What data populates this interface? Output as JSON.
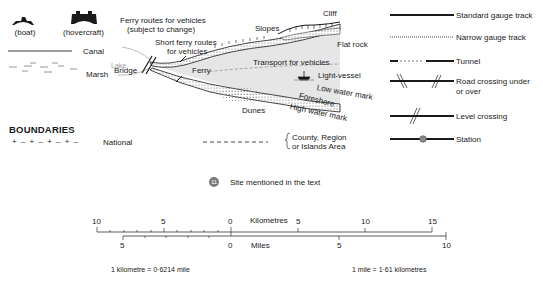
{
  "ferry_symbols": {
    "boat_label": "(boat)",
    "hovercraft_label": "(hovercraft)",
    "boat_icon": "boat-icon",
    "hovercraft_icon": "hovercraft-icon"
  },
  "water_features": {
    "canal": "Canal",
    "marsh": "Marsh",
    "lake": "Lake"
  },
  "coast_diagram": {
    "ferry_routes": "Ferry routes for vehicles",
    "ferry_routes_sub": "(subject to change)",
    "short_ferry_1": "Short ferry routes",
    "short_ferry_2": "for vehicles",
    "bridge": "Bridge",
    "ferry": "Ferry",
    "slopes": "Slopes",
    "cliff": "Cliff",
    "flat_rock": "Flat rock",
    "transport": "Transport for vehicles",
    "light_vessel": "Light-vessel",
    "light_vessel_icon": "light-vessel-icon",
    "low_water": "Low water mark",
    "foreshore": "Foreshore",
    "high_water": "High water mark",
    "dunes": "Dunes"
  },
  "railway_legend": [
    {
      "label": "Standard gauge track",
      "style": "solid"
    },
    {
      "label": "Narrow gauge track",
      "style": "dotted"
    },
    {
      "label": "Tunnel",
      "style": "tunnel"
    },
    {
      "label": "Road crossing under",
      "label2": "or over",
      "style": "road-crossing"
    },
    {
      "label": "Level crossing",
      "style": "level-crossing"
    },
    {
      "label": "Station",
      "style": "station"
    }
  ],
  "boundaries": {
    "heading": "BOUNDARIES",
    "national_symbol": "+ – + – + – + –",
    "national": "National",
    "county_1": "County, Region",
    "county_2": "or Islands Area"
  },
  "site": {
    "number": "11",
    "label": "Site mentioned in the text",
    "color": "#7a7a7a"
  },
  "scale": {
    "km_label": "Kilometres",
    "km_ticks": [
      "10",
      "5",
      "0",
      "5",
      "10",
      "15"
    ],
    "miles_label": "Miles",
    "miles_ticks": [
      "5",
      "0",
      "5",
      "10"
    ],
    "km_to_mile": "1 kilometre = 0·6214 mile",
    "mile_to_km": "1 mile = 1·61 kilometres"
  },
  "colors": {
    "ink": "#1a1a1a",
    "sea": "#e6e6e6",
    "stipple": "#8a8a8a",
    "lake": "#9a9a9a"
  }
}
